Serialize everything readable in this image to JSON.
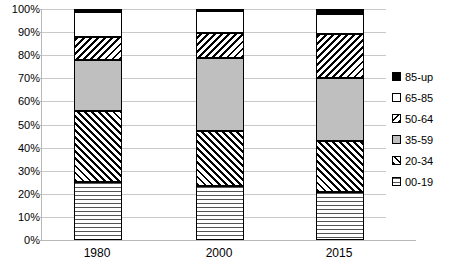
{
  "chart_data": {
    "type": "bar",
    "subtype": "stacked-100-percent",
    "title": "",
    "xlabel": "",
    "ylabel": "",
    "categories": [
      "1980",
      "2000",
      "2015"
    ],
    "ylim": [
      0,
      100
    ],
    "ytick_labels": [
      "0%",
      "10%",
      "20%",
      "30%",
      "40%",
      "50%",
      "60%",
      "70%",
      "80%",
      "90%",
      "100%"
    ],
    "ytick_values": [
      0,
      10,
      20,
      30,
      40,
      50,
      60,
      70,
      80,
      90,
      100
    ],
    "grid": true,
    "grid_axis": "y",
    "legend_position": "right",
    "stack_order_bottom_to_top": [
      "00-19",
      "20-34",
      "35-59",
      "50-64",
      "65-85",
      "85-up"
    ],
    "series": [
      {
        "name": "00-19",
        "pattern": "horizontal-lines",
        "values": [
          25.0,
          23.5,
          21.0
        ]
      },
      {
        "name": "20-34",
        "pattern": "diagonal-up-hatch",
        "values": [
          31.0,
          23.5,
          22.0
        ]
      },
      {
        "name": "35-59",
        "pattern": "solid-gray",
        "color": "#bfbfbf",
        "values": [
          22.0,
          32.0,
          27.0
        ]
      },
      {
        "name": "50-64",
        "pattern": "diagonal-down-hatch",
        "values": [
          10.0,
          10.5,
          19.0
        ]
      },
      {
        "name": "65-85",
        "pattern": "white-empty",
        "color": "#ffffff",
        "values": [
          10.5,
          9.5,
          9.0
        ]
      },
      {
        "name": "85-up",
        "pattern": "solid-black",
        "color": "#000000",
        "values": [
          1.5,
          1.0,
          2.0
        ]
      }
    ]
  },
  "legend": {
    "items": [
      {
        "label": "85-up"
      },
      {
        "label": "65-85"
      },
      {
        "label": "50-64"
      },
      {
        "label": "35-59"
      },
      {
        "label": "20-34"
      },
      {
        "label": "00-19"
      }
    ]
  },
  "axes": {
    "y": {
      "ticks": [
        {
          "label": "100%"
        },
        {
          "label": "90%"
        },
        {
          "label": "80%"
        },
        {
          "label": "70%"
        },
        {
          "label": "60%"
        },
        {
          "label": "50%"
        },
        {
          "label": "40%"
        },
        {
          "label": "30%"
        },
        {
          "label": "20%"
        },
        {
          "label": "10%"
        },
        {
          "label": "0%"
        }
      ]
    },
    "x": {
      "ticks": [
        {
          "label": "1980"
        },
        {
          "label": "2000"
        },
        {
          "label": "2015"
        }
      ]
    }
  }
}
